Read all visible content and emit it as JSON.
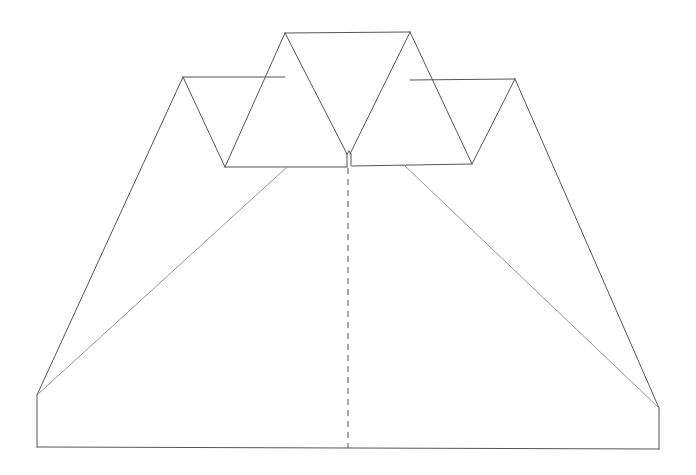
{
  "diagram": {
    "type": "paper-airplane-fold-pattern",
    "stroke_color": "#555555",
    "fold_line_style": "dashed",
    "outline": [
      [
        37,
        395
      ],
      [
        183,
        77
      ],
      [
        285,
        77
      ],
      [
        285,
        33
      ],
      [
        410,
        32
      ],
      [
        410,
        80
      ],
      [
        515,
        79
      ],
      [
        659,
        408
      ],
      [
        659,
        449
      ],
      [
        37,
        447
      ]
    ],
    "outer_edges": [
      {
        "from": [
          37,
          447
        ],
        "to": [
          37,
          395
        ]
      },
      {
        "from": [
          37,
          395
        ],
        "to": [
          183,
          77
        ]
      },
      {
        "from": [
          183,
          77
        ],
        "to": [
          285,
          77
        ]
      },
      {
        "from": [
          285,
          33
        ],
        "to": [
          410,
          32
        ]
      },
      {
        "from": [
          410,
          80
        ],
        "to": [
          515,
          79
        ]
      },
      {
        "from": [
          515,
          79
        ],
        "to": [
          659,
          408
        ]
      },
      {
        "from": [
          659,
          408
        ],
        "to": [
          659,
          449
        ]
      },
      {
        "from": [
          659,
          449
        ],
        "to": [
          37,
          447
        ]
      }
    ],
    "triangle_edges": [
      {
        "from": [
          183,
          77
        ],
        "to": [
          225,
          167
        ]
      },
      {
        "from": [
          225,
          167
        ],
        "to": [
          285,
          33
        ]
      },
      {
        "from": [
          285,
          33
        ],
        "to": [
          347,
          154
        ]
      },
      {
        "from": [
          350,
          154
        ],
        "to": [
          410,
          32
        ]
      },
      {
        "from": [
          410,
          32
        ],
        "to": [
          472,
          164
        ]
      },
      {
        "from": [
          472,
          164
        ],
        "to": [
          515,
          79
        ]
      }
    ],
    "base_edges": [
      {
        "from": [
          225,
          167
        ],
        "to": [
          347,
          167
        ]
      },
      {
        "from": [
          352,
          166
        ],
        "to": [
          472,
          164
        ]
      }
    ],
    "notch_edges": [
      {
        "from": [
          347,
          154
        ],
        "to": [
          347,
          167
        ]
      },
      {
        "from": [
          351,
          154
        ],
        "to": [
          351,
          166
        ]
      },
      {
        "from": [
          347,
          154
        ],
        "to": [
          349,
          151
        ]
      },
      {
        "from": [
          349,
          151
        ],
        "to": [
          351,
          154
        ]
      }
    ],
    "diagonal_folds": [
      {
        "from": [
          287,
          167
        ],
        "to": [
          37,
          395
        ]
      },
      {
        "from": [
          404,
          165
        ],
        "to": [
          659,
          408
        ]
      }
    ],
    "center_fold": {
      "from": [
        348,
        168
      ],
      "to": [
        348,
        448
      ]
    }
  }
}
